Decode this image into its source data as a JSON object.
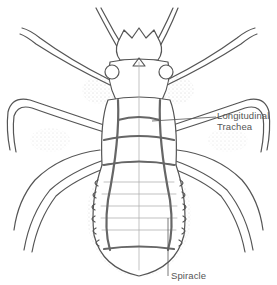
{
  "figure": {
    "colors": {
      "outline": "#555555",
      "trachea": "#6a6a6a",
      "stipple": "#9a9a9a",
      "label_text": "#555555",
      "background": "#ffffff"
    }
  },
  "labels": {
    "longitudinal_trachea": {
      "line1": "Longitudinal",
      "line2": "Trachea"
    },
    "spiracle": "Spiracle"
  }
}
